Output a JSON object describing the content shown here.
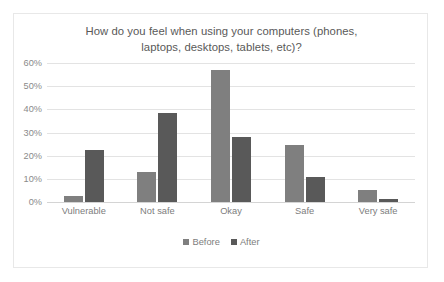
{
  "chart_data": {
    "type": "bar",
    "title": "How do you feel when using your computers (phones, laptops, desktops, tablets, etc)?",
    "title_line1": "How do you feel when using your computers (phones,",
    "title_line2": "laptops, desktops, tablets, etc)?",
    "xlabel": "",
    "ylabel": "",
    "ylim": [
      0,
      60
    ],
    "ytick_labels": [
      "60%",
      "50%",
      "40%",
      "30%",
      "20%",
      "10%",
      "0%"
    ],
    "ytick_values": [
      60,
      50,
      40,
      30,
      20,
      10,
      0
    ],
    "grid": true,
    "legend_position": "bottom",
    "categories": [
      "Vulnerable",
      "Not safe",
      "Okay",
      "Safe",
      "Very safe"
    ],
    "series": [
      {
        "name": "Before",
        "color": "#7f7f7f",
        "values": [
          2.5,
          13.0,
          57.0,
          24.5,
          5.3
        ]
      },
      {
        "name": "After",
        "color": "#595959",
        "values": [
          22.5,
          38.5,
          28.0,
          11.0,
          1.5
        ]
      }
    ]
  },
  "colors": {
    "before": "#7f7f7f",
    "after": "#595959",
    "gridline": "#e3e3e3",
    "border": "#e8e8e8",
    "text": "#7d7d7d",
    "title_text": "#595959",
    "background": "#ffffff"
  }
}
